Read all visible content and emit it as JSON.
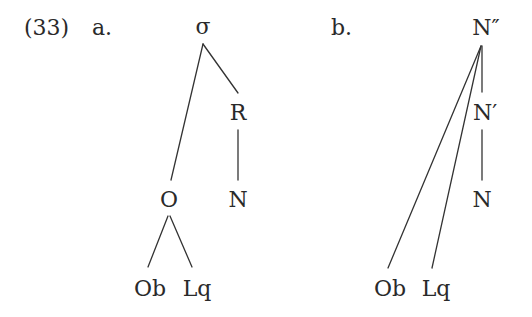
{
  "example": {
    "number": "(33)",
    "colors": {
      "text": "#2a2a2a",
      "line": "#333333",
      "background": "#ffffff"
    }
  },
  "tree_a": {
    "label": "a.",
    "nodes": {
      "root": "σ",
      "rhyme": "R",
      "nucleus": "N",
      "onset": "O",
      "obstruent": "Ob",
      "liquid": "Lq"
    },
    "edges": [
      [
        "σ",
        "O"
      ],
      [
        "σ",
        "R"
      ],
      [
        "R",
        "N"
      ],
      [
        "O",
        "Ob"
      ],
      [
        "O",
        "Lq"
      ]
    ]
  },
  "tree_b": {
    "label": "b.",
    "nodes": {
      "root": "N″",
      "bar": "N′",
      "head": "N",
      "obstruent": "Ob",
      "liquid": "Lq"
    },
    "edges": [
      [
        "N″",
        "N′"
      ],
      [
        "N′",
        "N"
      ],
      [
        "N″",
        "Ob"
      ],
      [
        "N″",
        "Lq"
      ]
    ]
  }
}
